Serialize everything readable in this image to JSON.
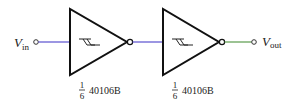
{
  "diagram": {
    "type": "circuit-schematic",
    "input": {
      "label_main": "V",
      "label_sub": "in"
    },
    "output": {
      "label_main": "V",
      "label_sub": "out"
    },
    "gates": [
      {
        "symbol": "schmitt-inverter",
        "frac_num": "1",
        "frac_den": "6",
        "part": "40106B"
      },
      {
        "symbol": "schmitt-inverter",
        "frac_num": "1",
        "frac_den": "6",
        "part": "40106B"
      }
    ],
    "colors": {
      "stroke": "#111111",
      "input_wire": "#5a4fcf",
      "mid_wire": "#5a4fcf",
      "output_wire": "#5a9a4a",
      "terminal": "#333333"
    }
  }
}
